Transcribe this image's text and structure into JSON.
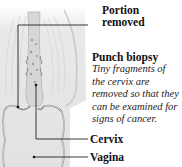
{
  "labels": {
    "portion_removed": [
      "Portion",
      "removed"
    ],
    "punch_biopsy_title": "Punch biopsy",
    "punch_biopsy_desc": [
      "Tiny fragments of",
      "the cervix are",
      "removed so that they",
      "can be examined for",
      "signs of cancer."
    ],
    "cervix": "Cervix",
    "vagina": "Vagina"
  },
  "colors": {
    "line": "#222222",
    "tissue_light": "#e6e6e6",
    "tissue_mid": "#cfcfcf",
    "tissue_dark": "#9a9a9a",
    "text": "#111111"
  }
}
